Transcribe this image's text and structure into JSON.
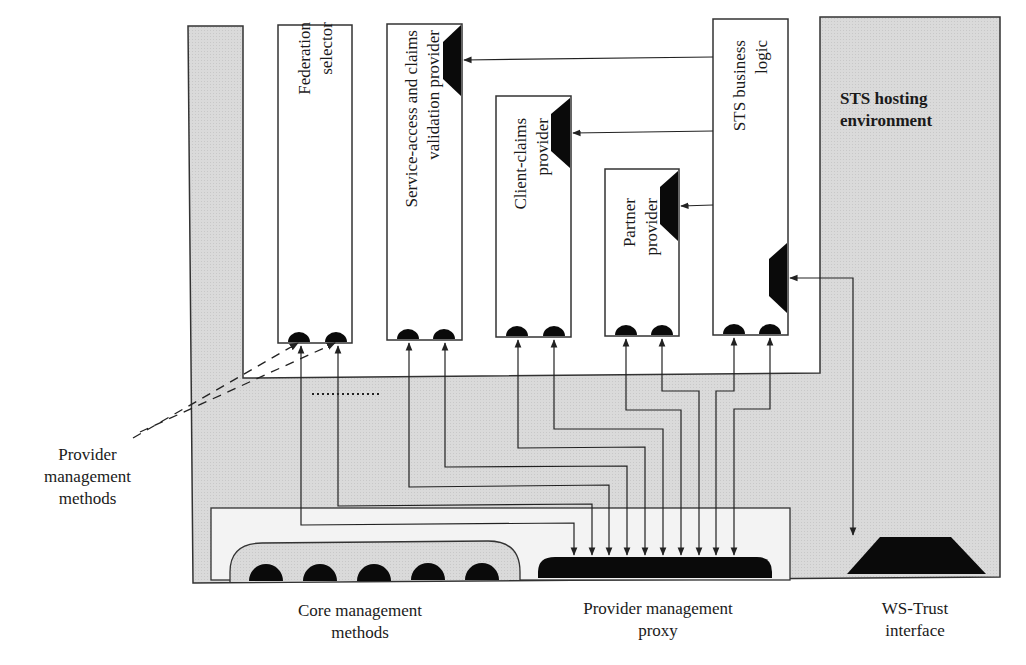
{
  "diagram": {
    "colors": {
      "gray_fill": "#d9d9d9",
      "light_fill": "#f2f2f2",
      "stroke": "#333333",
      "black": "#0a0a0a"
    },
    "environment": {
      "label": "STS hosting\nenvironment"
    },
    "components": [
      {
        "id": "federation-selector",
        "label": "Federation\nselector",
        "has_plug": false
      },
      {
        "id": "service-access",
        "label": "Service-access and claims\nvalidation provider",
        "has_plug": true
      },
      {
        "id": "client-claims",
        "label": "Client-claims\nprovider",
        "has_plug": true
      },
      {
        "id": "partner",
        "label": "Partner\nprovider",
        "has_plug": true
      },
      {
        "id": "sts-business-logic",
        "label": "STS business\nlogic",
        "has_plug": true
      }
    ],
    "bottom_labels": {
      "core_methods": "Core management\nmethods",
      "proxy": "Provider management\nproxy",
      "ws_trust": "WS-Trust\ninterface"
    },
    "side_labels": {
      "provider_methods": "Provider\nmanagement\nmethods"
    },
    "core_method_count": 5,
    "proxy_inputs": 10
  }
}
